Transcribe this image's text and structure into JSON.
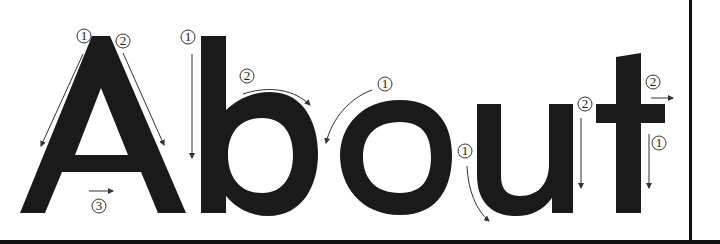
{
  "letters": [
    "A",
    "b",
    "o",
    "u",
    "t"
  ],
  "colors": {
    "ink": "#1a1a1a",
    "annotation": "#333333",
    "background": "#ffffff"
  },
  "annotations": [
    {
      "letter": "A",
      "step": "1",
      "direction": "diagonal-down-left"
    },
    {
      "letter": "A",
      "step": "2",
      "direction": "diagonal-down-right"
    },
    {
      "letter": "A",
      "step": "3",
      "direction": "horizontal-right"
    },
    {
      "letter": "b",
      "step": "1",
      "direction": "vertical-down"
    },
    {
      "letter": "b",
      "step": "2",
      "direction": "arc-clockwise"
    },
    {
      "letter": "o",
      "step": "1",
      "direction": "arc-counterclockwise"
    },
    {
      "letter": "u",
      "step": "1",
      "direction": "curve-down"
    },
    {
      "letter": "u",
      "step": "2",
      "direction": "vertical-down"
    },
    {
      "letter": "t",
      "step": "1",
      "direction": "vertical-down"
    },
    {
      "letter": "t",
      "step": "2",
      "direction": "horizontal-right"
    }
  ]
}
